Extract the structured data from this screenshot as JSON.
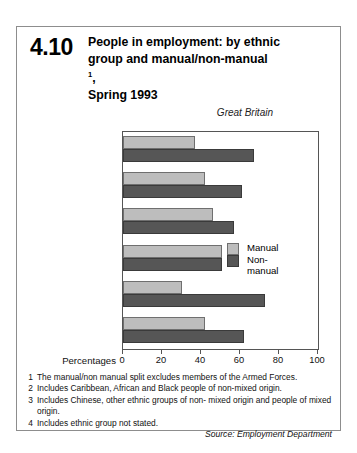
{
  "figure": {
    "number": "4.10",
    "title_lines": [
      "People in employment: by ethnic",
      "group and manual/non-manual",
      "Spring 1993"
    ],
    "title_footnote_marker": "1",
    "region": "Great Britain",
    "source": "Source: Employment Department"
  },
  "axis": {
    "name": "Percentages",
    "ticks": [
      "0",
      "20",
      "40",
      "60",
      "80",
      "100"
    ]
  },
  "legend": {
    "manual": "Manual",
    "nonmanual_line1": "Non-",
    "nonmanual_line2": "manual"
  },
  "categories": [
    {
      "line1": "Indian",
      "line2": "",
      "footnote": ""
    },
    {
      "line1": "White",
      "line2": "",
      "footnote": ""
    },
    {
      "line1": "Black",
      "line2": "",
      "footnote": "2"
    },
    {
      "line1": "Pakistani/",
      "line2": "Bangladeshi",
      "footnote": ""
    },
    {
      "line1": "Other or mixed",
      "line2": "",
      "footnote": "3"
    },
    {
      "line1": "All ethnic groups",
      "line2": "",
      "footnote": "4"
    }
  ],
  "notes": [
    {
      "n": "1",
      "text": "The manual/non manual split excludes members of the Armed Forces."
    },
    {
      "n": "2",
      "text": "Includes Caribbean, African and Black people of non-mixed origin."
    },
    {
      "n": "3",
      "text": "Includes Chinese, other ethnic groups of non- mixed origin and people of mixed origin."
    },
    {
      "n": "4",
      "text": "Includes ethnic group not stated."
    }
  ],
  "colors": {
    "manual": "#bdbdbd",
    "nonmanual": "#565656",
    "frame": "#8d8d8d"
  },
  "chart_data": {
    "type": "bar",
    "orientation": "horizontal",
    "subtitle": "Great Britain",
    "xlabel": "Percentages",
    "ylabel": "",
    "xlim": [
      0,
      100
    ],
    "xticks": [
      0,
      20,
      40,
      60,
      80,
      100
    ],
    "grid": false,
    "legend_position": "inside-right",
    "categories": [
      "Indian",
      "White",
      "Black",
      "Pakistani/Bangladeshi",
      "Other or mixed",
      "All ethnic groups"
    ],
    "series": [
      {
        "name": "Manual",
        "values": [
          37,
          42,
          46,
          51,
          30,
          42
        ]
      },
      {
        "name": "Non-manual",
        "values": [
          67,
          61,
          57,
          51,
          73,
          62
        ]
      }
    ]
  }
}
